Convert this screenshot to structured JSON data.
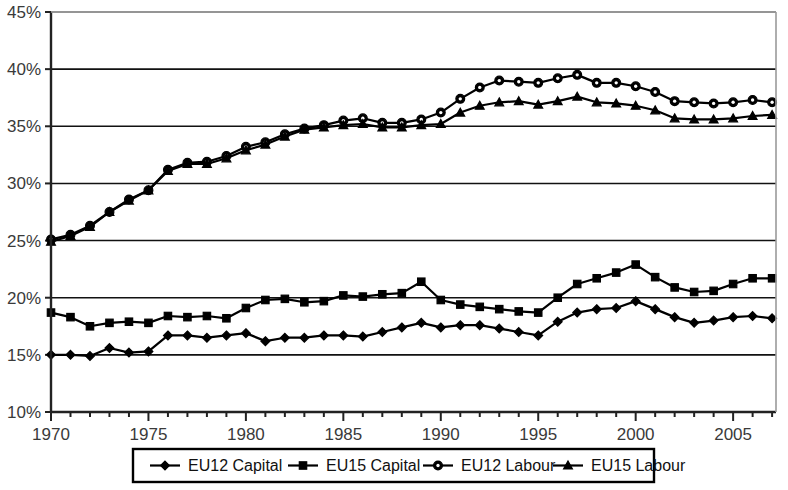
{
  "chart_data": {
    "type": "line",
    "title": "",
    "subtitle": "",
    "xlabel": "",
    "ylabel": "",
    "xlim": [
      1970,
      2007.2
    ],
    "ylim": [
      10,
      45
    ],
    "ytick_labels": [
      "10%",
      "15%",
      "20%",
      "25%",
      "30%",
      "35%",
      "40%",
      "45%"
    ],
    "ytick_values": [
      10,
      15,
      20,
      25,
      30,
      35,
      40,
      45
    ],
    "xtick_labels": [
      "1970",
      "1975",
      "1980",
      "1985",
      "1990",
      "1995",
      "2000",
      "2005"
    ],
    "xtick_values": [
      1970,
      1975,
      1980,
      1985,
      1990,
      1995,
      2000,
      2005
    ],
    "minor_xticks_every": 1,
    "grid": "horizontal",
    "legend_position": "bottom",
    "x": [
      1970,
      1971,
      1972,
      1973,
      1974,
      1975,
      1976,
      1977,
      1978,
      1979,
      1980,
      1981,
      1982,
      1983,
      1984,
      1985,
      1986,
      1987,
      1988,
      1989,
      1990,
      1991,
      1992,
      1993,
      1994,
      1995,
      1996,
      1997,
      1998,
      1999,
      2000,
      2001,
      2002,
      2003,
      2004,
      2005,
      2006,
      2007
    ],
    "series": [
      {
        "name": "EU12 Capital",
        "marker": "diamond",
        "color": "#000000",
        "values": [
          15.0,
          15.0,
          14.9,
          15.6,
          15.2,
          15.3,
          16.7,
          16.7,
          16.5,
          16.7,
          16.9,
          16.2,
          16.5,
          16.5,
          16.7,
          16.7,
          16.6,
          17.0,
          17.4,
          17.8,
          17.4,
          17.6,
          17.6,
          17.3,
          17.0,
          16.7,
          17.9,
          18.7,
          19.0,
          19.1,
          19.7,
          19.0,
          18.3,
          17.8,
          18.0,
          18.3,
          18.4,
          18.2
        ]
      },
      {
        "name": "EU15 Capital",
        "marker": "square",
        "color": "#000000",
        "values": [
          18.7,
          18.3,
          17.5,
          17.8,
          17.9,
          17.8,
          18.4,
          18.3,
          18.4,
          18.2,
          19.1,
          19.8,
          19.9,
          19.6,
          19.7,
          20.2,
          20.1,
          20.3,
          20.4,
          21.4,
          19.8,
          19.4,
          19.2,
          19.0,
          18.8,
          18.7,
          20.0,
          21.2,
          21.7,
          22.2,
          22.9,
          21.8,
          20.9,
          20.5,
          20.6,
          21.2,
          21.7,
          21.7
        ]
      },
      {
        "name": "EU12 Labour",
        "marker": "circle",
        "color": "#000000",
        "values": [
          25.1,
          25.5,
          26.3,
          27.5,
          28.6,
          29.4,
          31.2,
          31.8,
          31.9,
          32.4,
          33.2,
          33.6,
          34.3,
          34.8,
          35.1,
          35.5,
          35.7,
          35.3,
          35.3,
          35.6,
          36.2,
          37.4,
          38.4,
          39.0,
          38.9,
          38.8,
          39.2,
          39.5,
          38.8,
          38.8,
          38.5,
          38.0,
          37.2,
          37.1,
          37.0,
          37.1,
          37.3,
          37.1
        ]
      },
      {
        "name": "EU15 Labour",
        "marker": "triangle",
        "color": "#000000",
        "values": [
          24.9,
          25.4,
          26.2,
          27.5,
          28.5,
          29.4,
          31.1,
          31.7,
          31.7,
          32.2,
          32.9,
          33.4,
          34.1,
          34.7,
          34.9,
          35.1,
          35.2,
          34.9,
          34.9,
          35.1,
          35.2,
          36.2,
          36.8,
          37.1,
          37.2,
          36.9,
          37.2,
          37.6,
          37.1,
          37.0,
          36.8,
          36.4,
          35.7,
          35.6,
          35.6,
          35.7,
          35.9,
          36.0
        ]
      }
    ]
  },
  "legend": {
    "items": [
      {
        "label": "EU12 Capital",
        "marker": "diamond"
      },
      {
        "label": "EU15 Capital",
        "marker": "square"
      },
      {
        "label": "EU12 Labour",
        "marker": "circle"
      },
      {
        "label": "EU15 Labour",
        "marker": "triangle"
      }
    ]
  },
  "colors": {
    "line": "#000000",
    "axis": "#222222",
    "grid": "#111111",
    "tick_text": "#3a3a3a",
    "background": "#ffffff"
  }
}
